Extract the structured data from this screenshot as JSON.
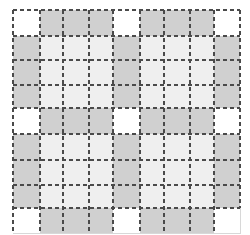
{
  "grid": {
    "rows": 9,
    "cols": 9,
    "col_lines": [
      13,
      40,
      63,
      89,
      113,
      140,
      164,
      190,
      214,
      240
    ],
    "row_lines": [
      10,
      36,
      60,
      85,
      108,
      134,
      160,
      185,
      208,
      233
    ],
    "line_style": "dashed",
    "line_color": "#4a4a4a",
    "colors": {
      "W": "#ffffff",
      "G": "#d0d0d0",
      "L": "#efefef"
    },
    "pattern": [
      [
        "W",
        "G",
        "G",
        "G",
        "W",
        "G",
        "G",
        "G",
        "W"
      ],
      [
        "G",
        "L",
        "L",
        "L",
        "G",
        "L",
        "L",
        "L",
        "G"
      ],
      [
        "G",
        "L",
        "L",
        "L",
        "G",
        "L",
        "L",
        "L",
        "G"
      ],
      [
        "G",
        "L",
        "L",
        "L",
        "G",
        "L",
        "L",
        "L",
        "G"
      ],
      [
        "W",
        "G",
        "G",
        "G",
        "W",
        "G",
        "G",
        "G",
        "W"
      ],
      [
        "G",
        "L",
        "L",
        "L",
        "G",
        "L",
        "L",
        "L",
        "G"
      ],
      [
        "G",
        "L",
        "L",
        "L",
        "G",
        "L",
        "L",
        "L",
        "G"
      ],
      [
        "G",
        "L",
        "L",
        "L",
        "G",
        "L",
        "L",
        "L",
        "G"
      ],
      [
        "W",
        "G",
        "G",
        "G",
        "W",
        "G",
        "G",
        "G",
        "W"
      ]
    ]
  }
}
